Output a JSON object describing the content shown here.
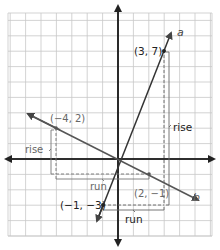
{
  "diagram": {
    "type": "coordinate-plane-slope",
    "origin_px": [
      118,
      159
    ],
    "unit_px": 15.4,
    "grid": {
      "x_min": -7,
      "x_max": 6,
      "y_min": -5,
      "y_max": 9,
      "color": "#c8c8c8"
    },
    "axis_color": "#222222",
    "colors": {
      "line_a": "#333333",
      "line_b": "#555555",
      "label_dark": "#222222",
      "label_light": "#666666",
      "guide": "#666666"
    }
  },
  "lines": [
    {
      "name": "a",
      "label": "a",
      "points": [
        [
          -1,
          -3
        ],
        [
          3,
          7
        ]
      ]
    },
    {
      "name": "b",
      "label": "b",
      "points": [
        [
          -4,
          2
        ],
        [
          2,
          -1
        ]
      ]
    }
  ],
  "points": [
    {
      "label": "(3, 7)",
      "x": 3,
      "y": 7
    },
    {
      "label": "(−4, 2)",
      "x": -4,
      "y": 2
    },
    {
      "label": "(−1, −3)",
      "x": -1,
      "y": -3
    },
    {
      "label": "(2, −1)",
      "x": 2,
      "y": -1
    }
  ],
  "annotations": {
    "rise_a": "rise",
    "run_a": "run",
    "rise_b": "rise",
    "run_b": "run"
  }
}
